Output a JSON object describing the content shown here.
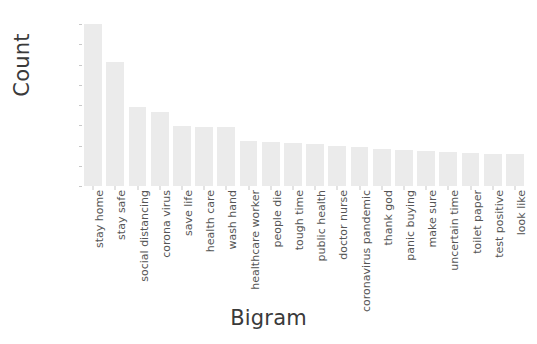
{
  "chart_data": {
    "type": "bar",
    "title": "",
    "xlabel": "Bigram",
    "ylabel": "Count",
    "ylim": [
      0,
      20000
    ],
    "yticks": [
      0,
      2500,
      5000,
      7500,
      10000,
      12500,
      15000,
      17500,
      20000
    ],
    "ytick_labels": [
      "0",
      "2500",
      "5000",
      "7500",
      "10000",
      "12500",
      "15000",
      "17500",
      "20000"
    ],
    "grid": false,
    "legend": "none",
    "bar_color": "#ebebeb",
    "categories": [
      "stay home",
      "stay safe",
      "social distancing",
      "corona virus",
      "save life",
      "health care",
      "wash hand",
      "healthcare worker",
      "people die",
      "tough time",
      "public health",
      "doctor nurse",
      "coronavirus pandemic",
      "thank god",
      "panic buying",
      "make sure",
      "uncertain time",
      "toilet paper",
      "test positive",
      "look like"
    ],
    "values": [
      20000,
      15250,
      9750,
      9100,
      7400,
      7300,
      7300,
      5600,
      5400,
      5300,
      5200,
      5000,
      4800,
      4600,
      4400,
      4300,
      4200,
      4100,
      4000,
      3900
    ]
  },
  "axes": {
    "y_title": "Count",
    "x_title": "Bigram"
  }
}
